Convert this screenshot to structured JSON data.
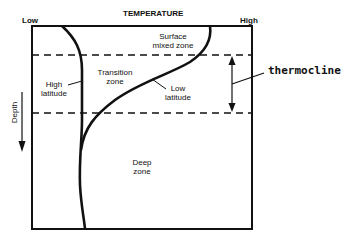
{
  "diagram": {
    "title": "TEMPERATURE",
    "axis": {
      "low_label": "Low",
      "high_label": "High",
      "depth_label": "Depth"
    },
    "zones": {
      "surface": [
        "Surface",
        "mixed zone"
      ],
      "transition": [
        "Transition",
        "zone"
      ],
      "deep": [
        "Deep",
        "zone"
      ]
    },
    "curves": {
      "high_latitude": [
        "High",
        "latitude"
      ],
      "low_latitude": [
        "Low",
        "latitude"
      ]
    },
    "annotation": {
      "thermocline": "thermocline"
    },
    "colors": {
      "ink": "#111111",
      "background": "#ffffff"
    }
  }
}
